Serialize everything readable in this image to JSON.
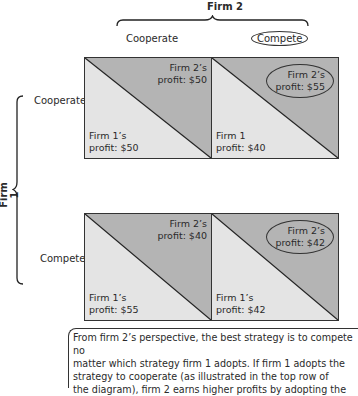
{
  "diagram": {
    "top_player": "Firm 2",
    "left_player": "Firm 1",
    "columns": [
      {
        "label": "Cooperate",
        "highlighted": false
      },
      {
        "label": "Compete",
        "highlighted": true
      }
    ],
    "rows": [
      {
        "label": "Cooperate"
      },
      {
        "label": "Compete"
      }
    ],
    "cells": [
      [
        {
          "firm2_line1": "Firm 2’s",
          "firm2_line2": "profit: $50",
          "firm1_line1": "Firm 1’s",
          "firm1_line2": "profit: $50",
          "firm2_circled": false
        },
        {
          "firm2_line1": "Firm 2’s",
          "firm2_line2": "profit: $55",
          "firm1_line1": "Firm 1",
          "firm1_line2": "profit: $40",
          "firm2_circled": true
        }
      ],
      [
        {
          "firm2_line1": "Firm 2’s",
          "firm2_line2": "profit: $40",
          "firm1_line1": "Firm 1’s",
          "firm1_line2": "profit: $55",
          "firm2_circled": false
        },
        {
          "firm2_line1": "Firm 2’s",
          "firm2_line2": "profit: $42",
          "firm1_line1": "Firm 1’s",
          "firm1_line2": "profit: $42",
          "firm2_circled": true
        }
      ]
    ],
    "colors": {
      "upper_triangle": "#b4b4b4",
      "lower_triangle": "#e4e4e4",
      "border": "#333333"
    }
  },
  "caption": {
    "lines": [
      "From firm 2’s perspective, the best strategy is to compete no",
      "matter which strategy firm 1 adopts. If firm 1 adopts the",
      "strategy to cooperate (as illustrated in the top row of",
      "the diagram), firm 2 earns higher profits by adopting the"
    ]
  }
}
